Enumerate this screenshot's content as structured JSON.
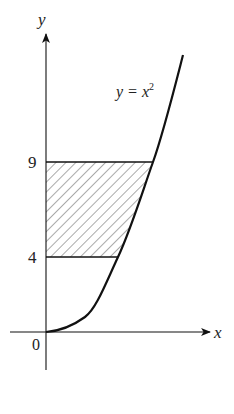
{
  "diagram": {
    "axes": {
      "x_label": "x",
      "y_label": "y",
      "origin_label": "0"
    },
    "curve": {
      "equation_lhs": "y = x",
      "equation_exp": "2"
    },
    "y_ticks": [
      {
        "value": 4,
        "label": "4"
      },
      {
        "value": 9,
        "label": "9"
      }
    ],
    "shaded_region": {
      "description": "Region between curve y = x^2 and the y-axis, for 4 ≤ y ≤ 9",
      "y_from": 4,
      "y_to": 9,
      "pattern": "diagonal hatching"
    },
    "colors": {
      "line": "#111111",
      "hatch": "#555555"
    }
  }
}
